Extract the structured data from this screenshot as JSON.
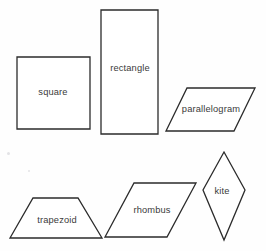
{
  "figure": {
    "background_color": "#fefefe",
    "stroke_color": "#2b2b2b",
    "label_color": "#3a3a3a",
    "width": 266,
    "height": 251
  },
  "shapes": [
    {
      "name": "square",
      "label": "square",
      "type": "square",
      "points": "17,57 90,57 90,129 17,129",
      "label_x": 53,
      "label_y": 93
    },
    {
      "name": "rectangle",
      "label": "rectangle",
      "type": "rectangle",
      "points": "101,10 158,10 158,134 101,134",
      "label_x": 130,
      "label_y": 69
    },
    {
      "name": "parallelogram",
      "label": "parallelogram",
      "type": "parallelogram",
      "points": "187,88 255,88 234,131 166,131",
      "label_x": 211,
      "label_y": 110
    },
    {
      "name": "trapezoid",
      "label": "trapezoid",
      "type": "trapezoid",
      "points": "33,198 78,198 102,238 10,238",
      "label_x": 57,
      "label_y": 221
    },
    {
      "name": "rhombus",
      "label": "rhombus",
      "type": "rhombus",
      "points": "134,183 196,183 167,237 105,237",
      "label_x": 152,
      "label_y": 211
    },
    {
      "name": "kite",
      "label": "kite",
      "type": "kite",
      "points": "224,152 245,190 224,240 203,190",
      "label_x": 222,
      "label_y": 192
    }
  ],
  "specks": [
    {
      "x": 7,
      "y": 152,
      "size": 3
    },
    {
      "x": 28,
      "y": 170,
      "size": 2
    }
  ]
}
